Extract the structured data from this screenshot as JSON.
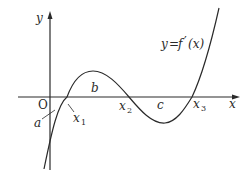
{
  "diagram": {
    "axes": {
      "x_label": "x",
      "y_label": "y",
      "origin_label": "O"
    },
    "curve": {
      "label_y": "y",
      "label_eq": "=",
      "label_f": "f",
      "label_prime": "′",
      "label_arg": "(x)"
    },
    "points": [
      {
        "name": "x",
        "sub": "1"
      },
      {
        "name": "x",
        "sub": "2"
      },
      {
        "name": "x",
        "sub": "3"
      }
    ],
    "regions": [
      {
        "label": "a"
      },
      {
        "label": "b"
      },
      {
        "label": "c"
      }
    ],
    "colors": {
      "stroke": "#2a2a2a",
      "background": "#ffffff"
    }
  }
}
